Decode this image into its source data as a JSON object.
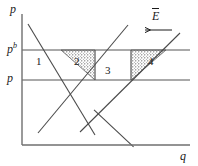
{
  "figure": {
    "type": "economics-supply-demand-diagram",
    "width": 198,
    "height": 166,
    "background": "#ffffff",
    "line_color": "#4a4a4a",
    "axis_color": "#6a6a6a",
    "text_color": "#1a1a1a",
    "stipple_color": "#4a4a4a"
  },
  "axes": {
    "y_label": "p",
    "x_label": "q",
    "y_axis_x": 22,
    "x_axis_y": 145,
    "x_axis_end": 190,
    "y_axis_top": 14
  },
  "price_lines": [
    {
      "name": "buyer-price",
      "label": "p",
      "superscript": "b",
      "y": 50,
      "x_start": 22,
      "x_end": 190
    },
    {
      "name": "seller-price",
      "label": "p",
      "superscript": "",
      "y": 80,
      "x_start": 22,
      "x_end": 190
    }
  ],
  "curves": [
    {
      "name": "demand-left",
      "x1": 28,
      "y1": 24,
      "x2": 95,
      "y2": 135,
      "direction": "downward"
    },
    {
      "name": "supply-left",
      "x1": 38,
      "y1": 133,
      "x2": 128,
      "y2": 25,
      "direction": "upward"
    },
    {
      "name": "demand-right",
      "x1": 80,
      "y1": 132,
      "x2": 140,
      "y2": 136,
      "direction": "downward"
    },
    {
      "name": "supply-right",
      "x1": 80,
      "y1": 132,
      "x2": 180,
      "y2": 33,
      "direction": "upward"
    }
  ],
  "regions": [
    {
      "id": "region-1",
      "label": "1",
      "x": 36,
      "y": 56,
      "shaded": false
    },
    {
      "id": "region-2",
      "label": "2",
      "x": 74,
      "y": 56,
      "shaded": true
    },
    {
      "id": "region-3",
      "label": "3",
      "x": 105,
      "y": 65,
      "shaded": false
    },
    {
      "id": "region-4",
      "label": "4",
      "x": 148,
      "y": 56,
      "shaded": true
    }
  ],
  "annotation": {
    "name": "endowment-label",
    "label": "E",
    "has_overbar": true,
    "arrow_direction": "left",
    "x": 148,
    "y": 16
  }
}
